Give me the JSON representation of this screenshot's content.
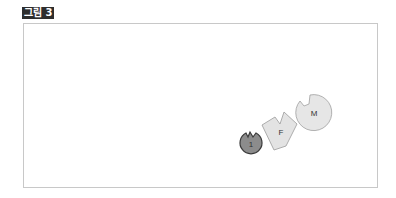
{
  "figure": {
    "label": "그림 3"
  },
  "diagram": {
    "shapes": [
      {
        "id": "1",
        "label": "1",
        "type": "notched-circle",
        "fill": "#8c8c8c",
        "stroke": "#3a3a3a"
      },
      {
        "id": "F",
        "label": "F",
        "type": "notched-polygon",
        "fill": "#e3e3e3",
        "stroke": "#9a9a9a"
      },
      {
        "id": "M",
        "label": "M",
        "type": "notched-circle",
        "fill": "#e6e6e6",
        "stroke": "#a0a0a0"
      }
    ]
  }
}
